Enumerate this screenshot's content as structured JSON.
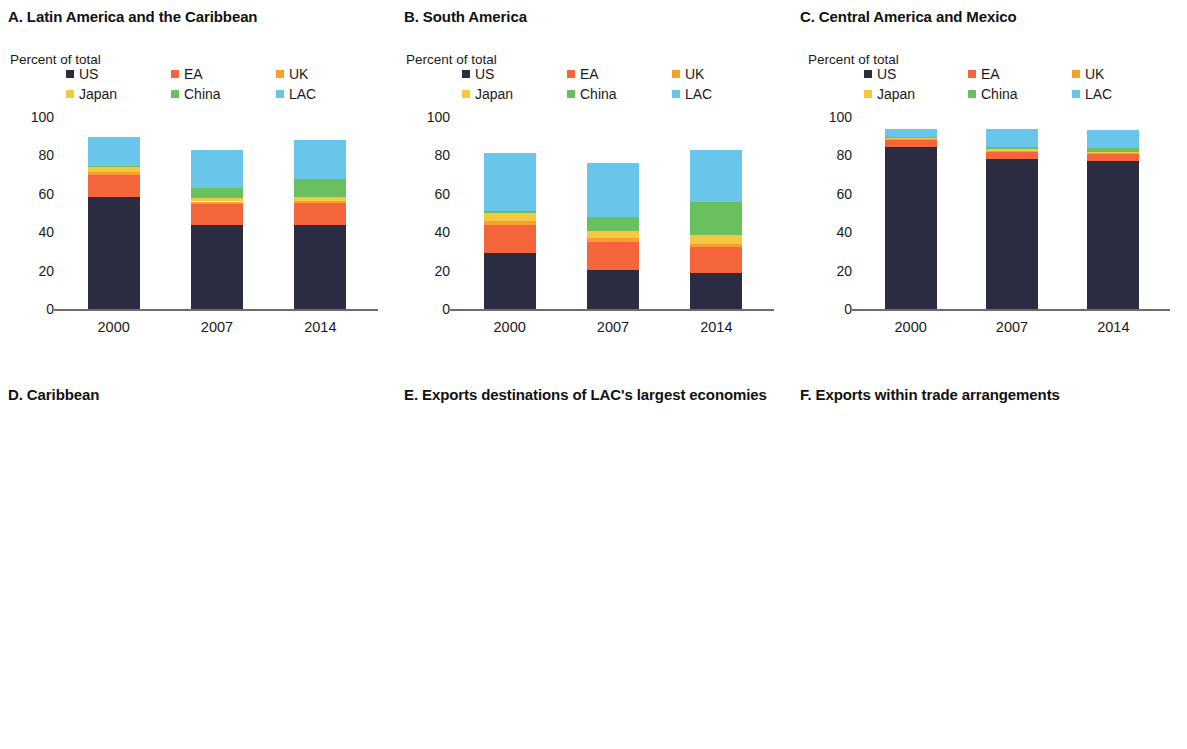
{
  "figure": {
    "axis_unit_label": "Percent of total",
    "colors": {
      "US": "#2b2b42",
      "EA": "#f4653c",
      "UK": "#f5a030",
      "Japan": "#f5c842",
      "China": "#6abf5e",
      "LAC": "#6ac5ea",
      "y1990": "#2b2b42",
      "y2000": "#f4653c",
      "y2014": "#f9ad3c",
      "axis": "#6d6d6d"
    }
  },
  "chart_data": [
    {
      "id": "panel-a",
      "type": "bar",
      "stacked": true,
      "title": "A. Latin America and the Caribbean",
      "ylabel": "Percent of total",
      "xlabel": "",
      "ylim": [
        0,
        100
      ],
      "yticks": [
        0,
        20,
        40,
        60,
        80,
        100
      ],
      "grid": false,
      "legend_position": "top",
      "categories": [
        "2000",
        "2007",
        "2014"
      ],
      "series": [
        {
          "name": "US",
          "values": [
            58.5,
            44.0,
            44.0
          ]
        },
        {
          "name": "EA",
          "values": [
            11.5,
            10.5,
            11.0
          ]
        },
        {
          "name": "UK",
          "values": [
            1.5,
            1.5,
            1.5
          ]
        },
        {
          "name": "Japan",
          "values": [
            2.5,
            2.0,
            2.0
          ]
        },
        {
          "name": "China",
          "values": [
            0.5,
            5.0,
            9.0
          ]
        },
        {
          "name": "LAC",
          "values": [
            15.0,
            20.0,
            20.5
          ]
        }
      ]
    },
    {
      "id": "panel-b",
      "type": "bar",
      "stacked": true,
      "title": "B. South America",
      "ylabel": "Percent of total",
      "xlabel": "",
      "ylim": [
        0,
        100
      ],
      "yticks": [
        0,
        20,
        40,
        60,
        80,
        100
      ],
      "grid": false,
      "legend_position": "top",
      "categories": [
        "2000",
        "2007",
        "2014"
      ],
      "series": [
        {
          "name": "US",
          "values": [
            29.0,
            20.5,
            19.0
          ]
        },
        {
          "name": "EA",
          "values": [
            15.0,
            14.5,
            13.5
          ]
        },
        {
          "name": "UK",
          "values": [
            2.0,
            2.0,
            1.5
          ]
        },
        {
          "name": "Japan",
          "values": [
            4.0,
            3.5,
            4.5
          ]
        },
        {
          "name": "China",
          "values": [
            1.0,
            7.5,
            17.0
          ]
        },
        {
          "name": "LAC",
          "values": [
            30.5,
            28.0,
            27.5
          ]
        }
      ]
    },
    {
      "id": "panel-c",
      "type": "bar",
      "stacked": true,
      "title": "C. Central America and Mexico",
      "ylabel": "Percent of total",
      "xlabel": "",
      "ylim": [
        0,
        100
      ],
      "yticks": [
        0,
        20,
        40,
        60,
        80,
        100
      ],
      "grid": false,
      "legend_position": "top",
      "categories": [
        "2000",
        "2007",
        "2014"
      ],
      "series": [
        {
          "name": "US",
          "values": [
            84.5,
            78.0,
            77.0
          ]
        },
        {
          "name": "EA",
          "values": [
            3.5,
            4.0,
            4.0
          ]
        },
        {
          "name": "UK",
          "values": [
            0.5,
            0.5,
            0.5
          ]
        },
        {
          "name": "Japan",
          "values": [
            0.5,
            1.0,
            0.5
          ]
        },
        {
          "name": "China",
          "values": [
            0.5,
            1.0,
            2.0
          ]
        },
        {
          "name": "LAC",
          "values": [
            4.5,
            9.5,
            9.5
          ]
        }
      ]
    },
    {
      "id": "panel-d",
      "type": "bar",
      "stacked": true,
      "title": "D. Caribbean",
      "ylabel": "Percent of total",
      "xlabel": "",
      "ylim": [
        0,
        100
      ],
      "yticks": [
        0,
        20,
        40,
        60,
        80,
        100
      ],
      "grid": false,
      "legend_position": "top",
      "categories": [
        "2000",
        "2007",
        "2014"
      ],
      "series": [
        {
          "name": "US",
          "values": [
            55.0,
            46.0,
            29.0
          ]
        },
        {
          "name": "EA",
          "values": [
            14.0,
            10.0,
            8.0
          ]
        },
        {
          "name": "UK",
          "values": [
            3.0,
            2.0,
            0.5
          ]
        },
        {
          "name": "Japan",
          "values": [
            1.0,
            0.5,
            0.5
          ]
        },
        {
          "name": "China",
          "values": [
            0.5,
            2.5,
            2.0
          ]
        },
        {
          "name": "LAC",
          "values": [
            12.5,
            20.0,
            35.0
          ]
        }
      ]
    },
    {
      "id": "panel-e",
      "type": "bar",
      "stacked": true,
      "title": "E. Exports destinations of LAC's largest economies",
      "ylabel": "Percent of total",
      "xlabel": "",
      "ylim": [
        0,
        100
      ],
      "yticks": [
        0,
        20,
        40,
        60,
        80,
        100
      ],
      "grid": false,
      "legend_position": "top",
      "categories": [
        "Mexico",
        "Brazil",
        "Venezuela, RB",
        "Chile",
        "Argentina",
        "Colombia"
      ],
      "series": [
        {
          "name": "US",
          "values": [
            80.0,
            11.0,
            29.0,
            12.0,
            5.5,
            25.0
          ]
        },
        {
          "name": "Euro Area",
          "values": [
            4.5,
            13.0,
            5.0,
            9.0,
            9.0,
            14.0
          ]
        },
        {
          "name": "UK",
          "values": [
            0.5,
            1.5,
            0.5,
            1.5,
            1.5,
            1.0
          ]
        },
        {
          "name": "Japan",
          "values": [
            1.0,
            3.0,
            1.5,
            9.0,
            1.5,
            1.0
          ]
        },
        {
          "name": "China",
          "values": [
            1.5,
            19.0,
            9.0,
            25.0,
            6.0,
            9.0
          ]
        },
        {
          "name": "LAC",
          "values": [
            4.0,
            23.0,
            9.0,
            21.0,
            37.0,
            31.0
          ]
        }
      ]
    },
    {
      "id": "panel-f",
      "type": "bar",
      "stacked": false,
      "title": "F. Exports within trade arrangements",
      "ylabel": "Percent of total",
      "xlabel": "",
      "ylim": [
        0,
        25
      ],
      "yticks": [
        0,
        5,
        10,
        15,
        20,
        25
      ],
      "grid": false,
      "legend_position": "top-right",
      "categories": [
        "Mercosur",
        "CACM",
        "Caricom",
        "PetroCaribe"
      ],
      "series": [
        {
          "name": "1990",
          "values": [
            7.3,
            15.0,
            7.7,
            5.5
          ]
        },
        {
          "name": "2000",
          "values": [
            16.0,
            19.5,
            13.8,
            7.2
          ]
        },
        {
          "name": "2014",
          "values": [
            13.0,
            22.0,
            12.5,
            6.3
          ]
        }
      ]
    }
  ]
}
